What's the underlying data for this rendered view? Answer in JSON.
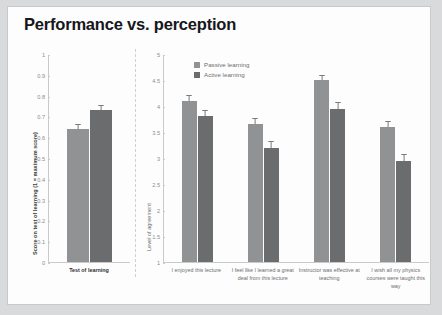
{
  "slide": {
    "title": "Performance vs. perception"
  },
  "legend": {
    "position": "top-center",
    "items": [
      {
        "label": "Passive learning",
        "color": "#909294"
      },
      {
        "label": "Active learning",
        "color": "#6a6c6e"
      }
    ]
  },
  "chart_data": [
    {
      "id": "performance",
      "type": "bar",
      "title": "",
      "xlabel": "",
      "ylabel": "Score on test of learning (1 = maximum score)",
      "ylim": [
        0,
        1
      ],
      "yticks": [
        "0",
        "0.1",
        "0.2",
        "0.3",
        "0.4",
        "0.5",
        "0.6",
        "0.7",
        "0.8",
        "0.9",
        "1"
      ],
      "grid": false,
      "legend": [
        "Passive learning",
        "Active learning"
      ],
      "categories": [
        "Test of learning"
      ],
      "series": [
        {
          "name": "Passive learning",
          "values": [
            0.64
          ],
          "errors": [
            0.025
          ],
          "color": "#909294"
        },
        {
          "name": "Active learning",
          "values": [
            0.73
          ],
          "errors": [
            0.025
          ],
          "color": "#6a6c6e"
        }
      ]
    },
    {
      "id": "perception",
      "type": "bar",
      "title": "",
      "xlabel": "",
      "ylabel": "Level of agreement",
      "ylim": [
        1,
        5
      ],
      "yticks": [
        "1",
        "1.5",
        "2",
        "2.5",
        "3",
        "3.5",
        "4",
        "4.5",
        "5"
      ],
      "grid": false,
      "legend": [
        "Passive learning",
        "Active learning"
      ],
      "categories": [
        "I enjoyed this lecture",
        "I feel like I learned a great deal from this lecture",
        "Instructor was effective at teaching",
        "I wish all my physics courses were taught this way"
      ],
      "series": [
        {
          "name": "Passive learning",
          "values": [
            4.1,
            3.65,
            4.5,
            3.6
          ],
          "errors": [
            0.12,
            0.12,
            0.1,
            0.12
          ],
          "color": "#909294"
        },
        {
          "name": "Active learning",
          "values": [
            3.8,
            3.2,
            3.95,
            2.95
          ],
          "errors": [
            0.12,
            0.12,
            0.12,
            0.12
          ],
          "color": "#6a6c6e"
        }
      ]
    }
  ]
}
